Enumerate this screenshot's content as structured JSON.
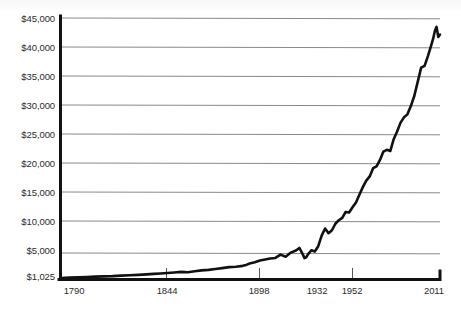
{
  "chart_data": {
    "type": "line",
    "title": "",
    "subtitle": "",
    "xlabel": "",
    "ylabel": "",
    "grid": true,
    "legend": false,
    "legend_position": "none",
    "xlim": [
      1790,
      2011
    ],
    "ylim": [
      1025,
      45000
    ],
    "y_tick_labels": [
      "$45,000",
      "$40,000",
      "$35,000",
      "$30,000",
      "$25,000",
      "$20,000",
      "$15,000",
      "$10,000",
      "$5,000",
      "$1,025"
    ],
    "y_tick_values": [
      45000,
      40000,
      35000,
      30000,
      25000,
      20000,
      15000,
      10000,
      5000,
      1025
    ],
    "x_tick_labels": [
      "1790",
      "1844",
      "1898",
      "1932",
      "1952",
      "2011"
    ],
    "x_tick_values": [
      1790,
      1844,
      1898,
      1932,
      1952,
      2011
    ],
    "x_ticks_drawn": [
      1790,
      1844,
      1898,
      1952,
      2011
    ],
    "series": [
      {
        "name": "Real income per capita",
        "color": "#111111",
        "x": [
          1790,
          1795,
          1800,
          1805,
          1810,
          1815,
          1820,
          1825,
          1830,
          1835,
          1840,
          1844,
          1848,
          1852,
          1856,
          1860,
          1864,
          1868,
          1872,
          1876,
          1880,
          1884,
          1888,
          1892,
          1896,
          1898,
          1900,
          1903,
          1906,
          1909,
          1912,
          1915,
          1918,
          1921,
          1924,
          1927,
          1929,
          1930,
          1931,
          1932,
          1933,
          1934,
          1936,
          1938,
          1940,
          1942,
          1944,
          1946,
          1948,
          1950,
          1952,
          1954,
          1956,
          1958,
          1960,
          1962,
          1964,
          1966,
          1968,
          1970,
          1972,
          1974,
          1976,
          1978,
          1980,
          1982,
          1984,
          1986,
          1988,
          1990,
          1992,
          1994,
          1996,
          1998,
          2000,
          2002,
          2004,
          2006,
          2007,
          2008,
          2009,
          2010,
          2011
        ],
        "y": [
          1025,
          1080,
          1150,
          1190,
          1260,
          1300,
          1340,
          1420,
          1480,
          1560,
          1640,
          1720,
          1790,
          1880,
          1960,
          2060,
          2010,
          2180,
          2320,
          2400,
          2560,
          2700,
          2860,
          2940,
          3080,
          3240,
          3480,
          3680,
          3980,
          4150,
          4320,
          4420,
          4980,
          4620,
          5320,
          5680,
          6100,
          5580,
          5020,
          4380,
          4520,
          5020,
          5720,
          5520,
          6400,
          8200,
          9400,
          8600,
          9100,
          10200,
          10800,
          11200,
          12200,
          12100,
          13000,
          13800,
          15100,
          16400,
          17500,
          18200,
          19600,
          19900,
          21000,
          22400,
          22700,
          22500,
          24500,
          25800,
          27300,
          28200,
          28700,
          30100,
          31800,
          34200,
          36600,
          36900,
          38600,
          40500,
          41500,
          42800,
          43500,
          41800,
          42200
        ]
      }
    ],
    "notable_features": [
      {
        "label": "Great Depression trough",
        "year": 1932,
        "value": 4380
      },
      {
        "label": "1929 peak",
        "year": 1929,
        "value": 6100
      },
      {
        "label": "Series peak",
        "year": 2009,
        "value": 43500
      },
      {
        "label": "Series start",
        "year": 1790,
        "value": 1025
      }
    ]
  },
  "axes": {
    "y_axis_name": "dollar-axis",
    "x_axis_name": "year-axis"
  }
}
